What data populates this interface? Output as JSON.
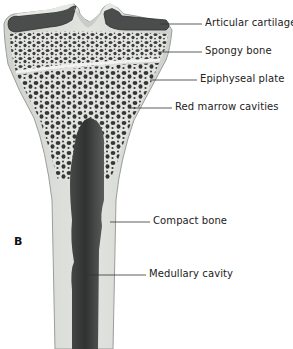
{
  "figure": {
    "panel_label": "B"
  },
  "labels": [
    {
      "text": "Articular cartilage",
      "x": 205,
      "y": 19,
      "line_from": [
        160,
        24
      ],
      "line_to": [
        202,
        24
      ]
    },
    {
      "text": "Spongy bone",
      "x": 205,
      "y": 47,
      "line_from": [
        158,
        52
      ],
      "line_to": [
        202,
        52
      ]
    },
    {
      "text": "Epiphyseal plate",
      "x": 200,
      "y": 74,
      "line_from": [
        150,
        80
      ],
      "line_to": [
        197,
        80
      ]
    },
    {
      "text": "Red marrow cavities",
      "x": 175,
      "y": 103,
      "line_from": [
        130,
        108
      ],
      "line_to": [
        172,
        108
      ]
    },
    {
      "text": "Compact bone",
      "x": 153,
      "y": 216,
      "line_from": [
        110,
        222
      ],
      "line_to": [
        150,
        222
      ]
    },
    {
      "text": "Medullary cavity",
      "x": 149,
      "y": 270,
      "line_from": [
        86,
        275
      ],
      "line_to": [
        146,
        275
      ]
    }
  ],
  "colors": {
    "background": "#ffffff",
    "bone_outer": "#d9dcd7",
    "bone_edge": "#9a9d99",
    "spongy_fill": "#e7e8e4",
    "pores": "#3a3d3b",
    "marrow_dark": "#333634",
    "marrow_mid": "#5b5e5c",
    "cartilage": "#4a4d4b",
    "cartilage_top": "#e6e8e4",
    "line": "#333333"
  }
}
